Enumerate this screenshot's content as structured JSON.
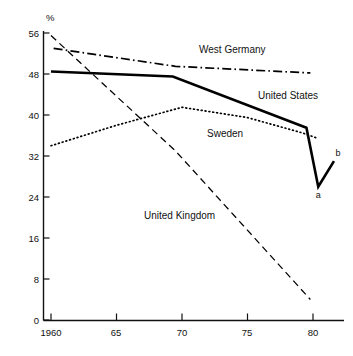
{
  "chart_data": {
    "type": "line",
    "title": "",
    "xlabel": "",
    "ylabel": "%",
    "xlim": [
      1960,
      1982
    ],
    "ylim": [
      0,
      56
    ],
    "grid": false,
    "legend_position": "inline-labels",
    "xticks": [
      1960,
      65,
      70,
      75,
      80
    ],
    "xtick_labels": [
      "1960",
      "65",
      "70",
      "75",
      "80"
    ],
    "yticks": [
      0,
      8,
      16,
      24,
      32,
      40,
      48,
      56
    ],
    "ytick_labels": [
      "0",
      "8",
      "16",
      "24",
      "32",
      "40",
      "48",
      "56"
    ],
    "series": [
      {
        "name": "West Germany",
        "style": "dash-dot",
        "x": [
          1960.2,
          1969.5,
          1979.8
        ],
        "values": [
          53.0,
          49.5,
          48.2
        ]
      },
      {
        "name": "United States",
        "style": "solid",
        "x": [
          1960.0,
          1969.3,
          1979.5,
          1980.4,
          1981.6
        ],
        "values": [
          48.5,
          47.5,
          37.5,
          26.0,
          31.0
        ]
      },
      {
        "name": "Sweden",
        "style": "dotted",
        "x": [
          1960.0,
          1965.0,
          1970.0,
          1975.0,
          1979.2,
          1980.3
        ],
        "values": [
          34.0,
          38.0,
          41.5,
          39.5,
          36.5,
          35.5
        ]
      },
      {
        "name": "United Kingdom",
        "style": "dashed",
        "x": [
          1960.0,
          1969.5,
          1979.8
        ],
        "values": [
          55.5,
          33.0,
          4.0
        ]
      }
    ],
    "annotations": [
      {
        "id": "a",
        "label": "a",
        "x": 1980.4,
        "y": 26.0,
        "note": "lower point of US dip"
      },
      {
        "id": "b",
        "label": "b",
        "x": 1981.6,
        "y": 31.0,
        "note": "upper right end of US line"
      }
    ],
    "series_labels": [
      {
        "text": "West Germany",
        "x": 199,
        "y": 53
      },
      {
        "text": "United States",
        "x": 258,
        "y": 99
      },
      {
        "text": "Sweden",
        "x": 207,
        "y": 137
      },
      {
        "text": "United Kingdom",
        "x": 144,
        "y": 219
      }
    ]
  },
  "axis": {
    "y_unit": "%"
  }
}
